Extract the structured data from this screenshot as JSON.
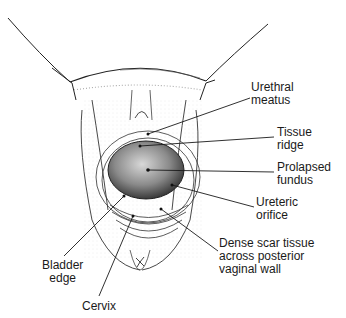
{
  "figure": {
    "labels": [
      {
        "id": "urethral-meatus",
        "text": "Urethral\nmeatus",
        "x": 251,
        "y": 81,
        "tip": [
          148,
          134
        ],
        "anchor": [
          250,
          98
        ]
      },
      {
        "id": "tissue-ridge",
        "text": "Tissue\nridge",
        "x": 277,
        "y": 126,
        "tip": [
          140,
          146
        ],
        "anchor": [
          274,
          137
        ]
      },
      {
        "id": "prolapsed-fundus",
        "text": "Prolapsed\nfundus",
        "x": 277,
        "y": 161,
        "tip": [
          148,
          170
        ],
        "anchor": [
          274,
          172
        ]
      },
      {
        "id": "ureteric-orifice",
        "text": "Ureteric\norifice",
        "x": 256,
        "y": 196,
        "tip": [
          172,
          185
        ],
        "anchor": [
          254,
          207
        ]
      },
      {
        "id": "dense-scar-tissue",
        "text": "Dense scar tissue\nacross posterior\nvaginal wall",
        "x": 219,
        "y": 237,
        "tip": [
          161,
          209
        ],
        "anchor": [
          218,
          251
        ]
      },
      {
        "id": "bladder-edge",
        "text": "Bladder\nedge",
        "x": 42,
        "y": 259,
        "tip": [
          124,
          196
        ],
        "anchor": [
          64,
          256
        ]
      },
      {
        "id": "cervix",
        "text": "Cervix",
        "x": 82,
        "y": 300,
        "tip": [
          133,
          216
        ],
        "anchor": [
          99,
          296
        ]
      }
    ]
  }
}
